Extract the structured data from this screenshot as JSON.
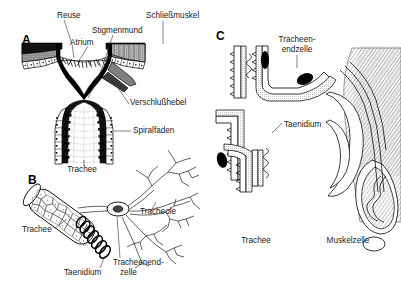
{
  "figure": {
    "background": "#ffffff",
    "ink_color": "#000000",
    "label_color": "#1a1a1a",
    "width": 401,
    "height": 289
  },
  "panels": [
    {
      "id": "A",
      "letter": "A",
      "caption": "Stigma im Laengsschnitt",
      "x": 22,
      "y": 40,
      "labels": [
        {
          "name": "reuse",
          "text": "Reuse",
          "x": 57,
          "y": 18,
          "anchor": "start"
        },
        {
          "name": "atrium",
          "text": "Atrium",
          "x": 70,
          "y": 45,
          "anchor": "start"
        },
        {
          "name": "stigmenmund",
          "text": "Stigmenmund",
          "x": 92,
          "y": 33,
          "anchor": "start"
        },
        {
          "name": "schliessmuskel",
          "text": "Schließmuskel",
          "x": 146,
          "y": 18,
          "anchor": "start"
        },
        {
          "name": "verschlusshebel",
          "text": "Verschlußhebel",
          "x": 130,
          "y": 105,
          "anchor": "start"
        },
        {
          "name": "spiralfaden",
          "text": "Spiralfaden",
          "x": 133,
          "y": 133,
          "anchor": "start"
        },
        {
          "name": "trachee-a",
          "text": "Trachee",
          "x": 82,
          "y": 170,
          "anchor": "middle"
        }
      ]
    },
    {
      "id": "B",
      "letter": "B",
      "caption": "Trachee mit Tracheolen",
      "x": 28,
      "y": 178,
      "labels": [
        {
          "name": "trachee-b",
          "text": "Trachee",
          "x": 22,
          "y": 232,
          "anchor": "start"
        },
        {
          "name": "taenidium-b",
          "text": "Taenidium",
          "x": 64,
          "y": 273,
          "anchor": "start"
        },
        {
          "name": "tracheole",
          "text": "Tracheole",
          "x": 140,
          "y": 214,
          "anchor": "start"
        },
        {
          "name": "tracheenendzelle1",
          "text": "Tracheenend-",
          "x": 115,
          "y": 263,
          "anchor": "start"
        },
        {
          "name": "tracheenendzelle2",
          "text": "zelle",
          "x": 122,
          "y": 273,
          "anchor": "start"
        }
      ]
    },
    {
      "id": "C",
      "letter": "C",
      "caption": "Tracheenendzellen an Muskelzelle",
      "x": 216,
      "y": 34,
      "labels": [
        {
          "name": "tracheenendzelle-c1",
          "text": "Tracheen-",
          "x": 297,
          "y": 40,
          "anchor": "middle"
        },
        {
          "name": "tracheenendzelle-c2",
          "text": "endzelle",
          "x": 297,
          "y": 50,
          "anchor": "middle"
        },
        {
          "name": "taenidium-c",
          "text": "Taenidium",
          "x": 284,
          "y": 125,
          "anchor": "start"
        },
        {
          "name": "trachee-c",
          "text": "Trachee",
          "x": 256,
          "y": 240,
          "anchor": "middle"
        },
        {
          "name": "muskelzelle",
          "text": "Muskelzelle",
          "x": 348,
          "y": 240,
          "anchor": "middle"
        }
      ]
    }
  ]
}
